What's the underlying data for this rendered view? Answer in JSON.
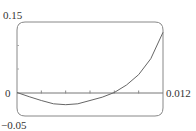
{
  "chart_data": {
    "type": "line",
    "title": "",
    "xlabel": "",
    "ylabel": "",
    "xlim": [
      0,
      0.012
    ],
    "ylim": [
      -0.05,
      0.15
    ],
    "x_tick_step": 0.002,
    "y_tick_step": 0.05,
    "tick_labels": {
      "y_top": "0.15",
      "y_zero": "0",
      "y_bottom": "−0.05",
      "x_right": "0.012"
    },
    "grid": false,
    "legend": null,
    "series": [
      {
        "name": "curve",
        "x": [
          0,
          0.001,
          0.002,
          0.003,
          0.004,
          0.005,
          0.006,
          0.007,
          0.008,
          0.009,
          0.01,
          0.011,
          0.012
        ],
        "y": [
          0,
          -0.009,
          -0.017,
          -0.024,
          -0.026,
          -0.024,
          -0.017,
          -0.01,
          0,
          0.016,
          0.038,
          0.072,
          0.128
        ]
      }
    ]
  }
}
